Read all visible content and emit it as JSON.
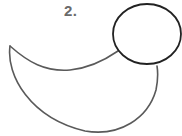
{
  "step": {
    "label": "2."
  },
  "drawing": {
    "subject": "duck-outline",
    "colors": {
      "head_stroke": "#222222",
      "body_stroke": "#5a5a5a",
      "background": "#ffffff"
    },
    "head": {
      "shape": "circle",
      "cx": 147,
      "cy": 34,
      "rx": 34,
      "ry": 30
    },
    "body": {
      "shape": "crescent",
      "tail_tip": [
        10,
        46
      ]
    }
  }
}
